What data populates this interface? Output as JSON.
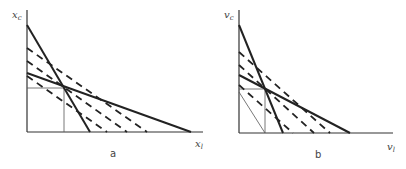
{
  "panels": [
    {
      "id": "a",
      "caption": "a",
      "y_axis_label": "x_c",
      "y_axis_label_main": "x",
      "y_axis_label_sub": "c",
      "x_axis_label_main": "x",
      "x_axis_label_sub": "l",
      "lines": {
        "solid": [
          {
            "name": "steep-solid",
            "from": [
              27,
              25
            ],
            "to": [
              90,
              132
            ]
          },
          {
            "name": "shallow-solid",
            "from": [
              27,
              73
            ],
            "to": [
              191,
              132
            ]
          }
        ],
        "dashed": [
          {
            "name": "dashed-1",
            "from": [
              27,
              48
            ],
            "to": [
              147,
              132
            ]
          },
          {
            "name": "dashed-2",
            "from": [
              27,
              61
            ],
            "to": [
              127,
              132
            ]
          },
          {
            "name": "dashed-3",
            "from": [
              27,
              76
            ],
            "to": [
              107,
              132
            ]
          }
        ],
        "guides": [
          {
            "name": "horizontal-guide",
            "from": [
              27,
              88
            ],
            "to": [
              64,
              88
            ]
          },
          {
            "name": "vertical-guide",
            "from": [
              64,
              88
            ],
            "to": [
              64,
              132
            ]
          }
        ]
      }
    },
    {
      "id": "b",
      "caption": "b",
      "y_axis_label": "v_c",
      "y_axis_label_main": "v",
      "y_axis_label_sub": "c",
      "x_axis_label_main": "v",
      "x_axis_label_sub": "l",
      "lines": {
        "solid": [
          {
            "name": "steep-solid",
            "from": [
              239,
              25
            ],
            "to": [
              283,
              133
            ]
          },
          {
            "name": "shallow-solid",
            "from": [
              239,
              75
            ],
            "to": [
              350,
              133
            ]
          }
        ],
        "dashed": [
          {
            "name": "dashed-1",
            "from": [
              239,
              52
            ],
            "to": [
              330,
              133
            ]
          },
          {
            "name": "dashed-2",
            "from": [
              239,
              65
            ],
            "to": [
              314,
              133
            ]
          },
          {
            "name": "dashed-3",
            "from": [
              239,
              85
            ],
            "to": [
              293,
              133
            ]
          }
        ],
        "guides": [
          {
            "name": "horizontal-guide",
            "from": [
              239,
              89
            ],
            "to": [
              265,
              89
            ]
          },
          {
            "name": "vertical-guide",
            "from": [
              265,
              89
            ],
            "to": [
              265,
              133
            ]
          },
          {
            "name": "thin-diagonal",
            "from": [
              239,
              92
            ],
            "to": [
              265,
              133
            ]
          }
        ]
      }
    }
  ]
}
